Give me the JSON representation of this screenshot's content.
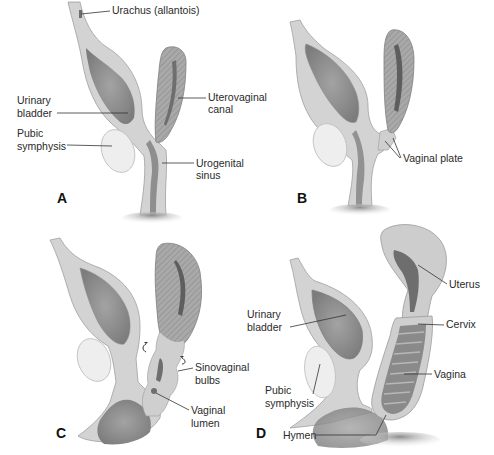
{
  "figure": {
    "topic": "Development of the vagina (sagittal sections)",
    "colors": {
      "tissue_light": "#d4d4d4",
      "tissue_mid": "#b8b8b8",
      "lumen_dark": "#8a8a8a",
      "lumen_darker": "#6e6e6e",
      "hatch_fill": "#a9a9a9",
      "pubis_fill": "#eeeeee",
      "outline": "#9a9a9a",
      "leader_line": "#333333"
    },
    "panels": [
      {
        "id": "A",
        "letter": "A",
        "labels": {
          "urachus": "Urachus (allantois)",
          "bladder_1": "Urinary",
          "bladder_2": "bladder",
          "uterovaginal_1": "Uterovaginal",
          "uterovaginal_2": "canal",
          "pubic_1": "Pubic",
          "pubic_2": "symphysis",
          "urogenital_1": "Urogenital",
          "urogenital_2": "sinus"
        }
      },
      {
        "id": "B",
        "letter": "B",
        "labels": {
          "vaginal_plate": "Vaginal plate"
        }
      },
      {
        "id": "C",
        "letter": "C",
        "labels": {
          "sinovaginal_1": "Sinovaginal",
          "sinovaginal_2": "bulbs",
          "lumen_1": "Vaginal",
          "lumen_2": "lumen"
        }
      },
      {
        "id": "D",
        "letter": "D",
        "labels": {
          "bladder_1": "Urinary",
          "bladder_2": "bladder",
          "uterus": "Uterus",
          "cervix": "Cervix",
          "vagina": "Vagina",
          "pubic_1": "Pubic",
          "pubic_2": "symphysis",
          "hymen": "Hymen"
        }
      }
    ]
  }
}
